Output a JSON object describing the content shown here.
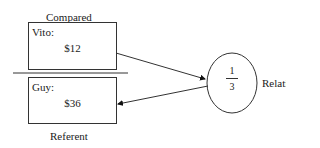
{
  "diagram": {
    "compared_label": "Compared",
    "referent_label": "Referent",
    "relation_label": "Relation",
    "compared_box": {
      "name": "Vito:",
      "value": "$12"
    },
    "referent_box": {
      "name": "Guy:",
      "value": "$36"
    },
    "relation": {
      "numerator": "1",
      "denominator": "3"
    }
  }
}
